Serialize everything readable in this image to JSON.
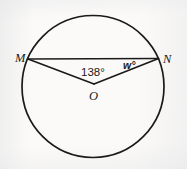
{
  "figure": {
    "background_color": "#fbfaf8",
    "stroke_color": "#1a1a1a",
    "width": 187,
    "height": 169
  },
  "geometry": {
    "circle": {
      "cx": 93,
      "cy": 86.5,
      "r": 71,
      "stroke_width": 1.7
    },
    "points": {
      "M": {
        "x": 28,
        "y": 59,
        "label": "M"
      },
      "N": {
        "x": 158.5,
        "y": 58.5,
        "label": "N"
      },
      "O": {
        "x": 94,
        "y": 84,
        "label": "O"
      }
    },
    "segments": [
      {
        "name": "chord-MN",
        "from": "M",
        "to": "N",
        "stroke_width": 1.6
      },
      {
        "name": "radius-OM",
        "from": "O",
        "to": "M",
        "stroke_width": 1.6
      },
      {
        "name": "radius-ON",
        "from": "O",
        "to": "N",
        "stroke_width": 1.6
      }
    ]
  },
  "labels": {
    "point_m": "M",
    "point_n": "N",
    "point_o": "O",
    "angle_center": "138°",
    "angle_w": "w°"
  },
  "artifacts": {
    "bottom_smudge": "         ",
    "top_smudge": "       "
  }
}
